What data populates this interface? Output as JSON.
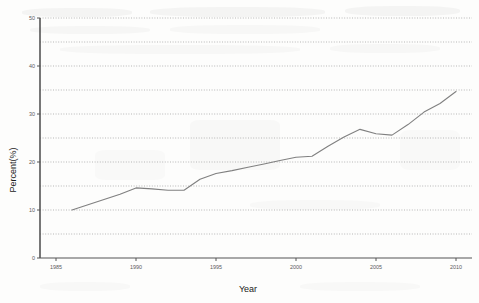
{
  "chart_data": {
    "type": "line",
    "title": "",
    "xlabel": "Year",
    "ylabel": "Percent(%)",
    "xlim": [
      1984,
      2011
    ],
    "ylim": [
      0,
      50
    ],
    "xticks": [
      1985,
      1990,
      1995,
      2000,
      2005,
      2010
    ],
    "xticklabels": [
      "1985",
      "1990",
      "1995",
      "2000",
      "2005",
      "2010"
    ],
    "yticks": [
      0,
      10,
      20,
      30,
      40,
      50
    ],
    "yticklabels": [
      "0",
      "10",
      "20",
      "30",
      "40",
      "50"
    ],
    "gridlines_y": [
      5,
      10,
      15,
      20,
      25,
      30,
      35,
      40,
      45,
      50
    ],
    "grid": true,
    "grid_style": "dotted",
    "legend": null,
    "line_color": "#808080",
    "series": [
      {
        "name": "Percent",
        "x": [
          1986,
          1987,
          1988,
          1989,
          1990,
          1991,
          1992,
          1993,
          1994,
          1995,
          1996,
          1997,
          1998,
          1999,
          2000,
          2001,
          2002,
          2003,
          2004,
          2005,
          2006,
          2007,
          2008,
          2009,
          2010
        ],
        "values": [
          10.0,
          11.1,
          12.2,
          13.3,
          14.6,
          14.4,
          14.1,
          14.1,
          16.4,
          17.6,
          18.2,
          18.9,
          19.6,
          20.3,
          21.0,
          21.2,
          23.3,
          25.2,
          26.8,
          25.9,
          25.6,
          27.8,
          30.4,
          32.2,
          34.7
        ]
      }
    ]
  },
  "axes": {
    "y_title": "Percent(%)",
    "x_title": "Year"
  }
}
